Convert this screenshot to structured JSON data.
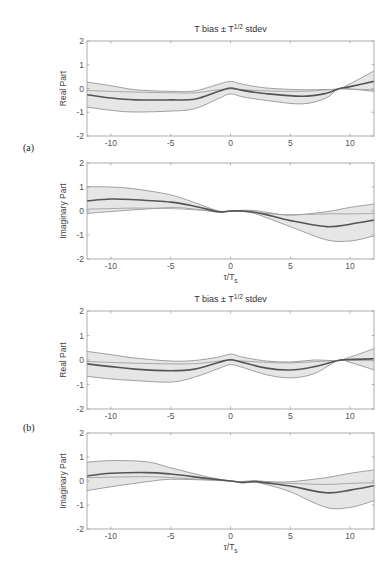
{
  "figure": {
    "width": 392,
    "height": 573,
    "colors": {
      "band_fill": "#e6e6e6",
      "band_edge": "#8a8a8a",
      "mean_line": "#555555",
      "ref_line": "#a0a0a0",
      "axis": "#9a9a9a"
    }
  },
  "chart_data": [
    {
      "type": "area",
      "group": "(a)",
      "title": "T bias ± T^{1/2} stdev",
      "title_main": "T bias ± T",
      "title_sup": "1/2",
      "title_tail": " stdev",
      "xlabel": "",
      "ylabel": "Real Part",
      "xlim": [
        -12,
        12
      ],
      "ylim": [
        -2,
        2
      ],
      "xticks": [
        -10,
        -5,
        0,
        5,
        10
      ],
      "yticks": [
        -2,
        -1,
        0,
        1,
        2
      ],
      "grid": false,
      "box": {
        "x0": 87,
        "x1": 374,
        "y_top": 41,
        "y_bot": 136
      },
      "x": [
        -12,
        -10,
        -8,
        -5,
        -3,
        -1,
        0,
        1,
        3,
        6,
        8,
        9,
        10,
        12
      ],
      "series": [
        {
          "name": "upper (bias + stdev)",
          "values": [
            0.27,
            0.12,
            -0.05,
            -0.12,
            -0.1,
            0.18,
            0.3,
            0.18,
            0.02,
            -0.05,
            -0.04,
            -0.02,
            0.2,
            0.74
          ]
        },
        {
          "name": "bias (mean)",
          "values": [
            -0.26,
            -0.4,
            -0.48,
            -0.48,
            -0.45,
            -0.12,
            0.02,
            -0.08,
            -0.22,
            -0.33,
            -0.2,
            -0.02,
            0.08,
            0.3
          ]
        },
        {
          "name": "lower (bias - stdev)",
          "values": [
            -0.78,
            -0.92,
            -0.99,
            -0.95,
            -0.85,
            -0.42,
            -0.23,
            -0.35,
            -0.5,
            -0.65,
            -0.4,
            -0.02,
            -0.02,
            -0.12
          ]
        },
        {
          "name": "reference",
          "values": [
            -0.08,
            -0.12,
            -0.15,
            -0.18,
            -0.18,
            -0.05,
            -0.02,
            -0.05,
            -0.1,
            -0.12,
            -0.06,
            -0.02,
            -0.03,
            -0.05
          ]
        }
      ]
    },
    {
      "type": "area",
      "group": "(a)",
      "title": "",
      "xlabel": "τ/T_s",
      "xlabel_main": "τ/T",
      "xlabel_sub": "s",
      "ylabel": "Imaginary Part",
      "xlim": [
        -12,
        12
      ],
      "ylim": [
        -2,
        2
      ],
      "xticks": [
        -10,
        -5,
        0,
        5,
        10
      ],
      "yticks": [
        -2,
        -1,
        0,
        1,
        2
      ],
      "grid": false,
      "box": {
        "x0": 87,
        "x1": 374,
        "y_top": 163,
        "y_bot": 259
      },
      "x": [
        -12,
        -10,
        -8,
        -5,
        -3,
        -1,
        0,
        1,
        2,
        3,
        5,
        8,
        10,
        12
      ],
      "series": [
        {
          "name": "upper (bias + stdev)",
          "values": [
            1.01,
            1.0,
            0.92,
            0.67,
            0.35,
            0.0,
            0.0,
            0.03,
            0.02,
            -0.05,
            -0.17,
            -0.03,
            0.15,
            0.29
          ]
        },
        {
          "name": "bias (mean)",
          "values": [
            0.42,
            0.5,
            0.47,
            0.37,
            0.2,
            -0.03,
            0.0,
            0.0,
            -0.05,
            -0.15,
            -0.4,
            -0.65,
            -0.55,
            -0.38
          ]
        },
        {
          "name": "lower (bias - stdev)",
          "values": [
            -0.1,
            -0.02,
            0.05,
            0.14,
            0.08,
            -0.05,
            0.0,
            -0.02,
            -0.1,
            -0.28,
            -0.65,
            -1.2,
            -1.25,
            -1.04
          ]
        },
        {
          "name": "reference",
          "values": [
            0.08,
            0.1,
            0.12,
            0.1,
            0.05,
            -0.02,
            0.0,
            0.0,
            -0.05,
            -0.1,
            -0.16,
            -0.12,
            -0.12,
            -0.1
          ]
        }
      ]
    },
    {
      "type": "area",
      "group": "(b)",
      "title": "T bias ± T^{1/2} stdev",
      "title_main": "T bias ± T",
      "title_sup": "1/2",
      "title_tail": " stdev",
      "xlabel": "",
      "ylabel": "Real Part",
      "xlim": [
        -12,
        12
      ],
      "ylim": [
        -2,
        2
      ],
      "xticks": [
        -10,
        -5,
        0,
        5,
        10
      ],
      "yticks": [
        -2,
        -1,
        0,
        1,
        2
      ],
      "grid": false,
      "box": {
        "x0": 87,
        "x1": 374,
        "y_top": 311,
        "y_bot": 409
      },
      "x": [
        -12,
        -10,
        -8,
        -5,
        -3,
        -1,
        0,
        1,
        3,
        5,
        7,
        9,
        10,
        12
      ],
      "series": [
        {
          "name": "upper (bias + stdev)",
          "values": [
            0.35,
            0.22,
            0.08,
            -0.04,
            -0.02,
            0.12,
            0.24,
            0.12,
            -0.04,
            -0.08,
            0.0,
            -0.02,
            0.12,
            0.46
          ]
        },
        {
          "name": "bias (mean)",
          "values": [
            -0.16,
            -0.27,
            -0.37,
            -0.44,
            -0.37,
            -0.1,
            0.01,
            -0.1,
            -0.33,
            -0.41,
            -0.27,
            -0.02,
            0.02,
            0.05
          ]
        },
        {
          "name": "lower (bias - stdev)",
          "values": [
            -0.67,
            -0.77,
            -0.84,
            -0.9,
            -0.7,
            -0.35,
            -0.19,
            -0.3,
            -0.6,
            -0.73,
            -0.56,
            -0.02,
            -0.1,
            -0.4
          ]
        },
        {
          "name": "reference",
          "values": [
            -0.06,
            -0.1,
            -0.13,
            -0.16,
            -0.15,
            -0.05,
            -0.01,
            -0.04,
            -0.1,
            -0.12,
            -0.07,
            -0.02,
            -0.02,
            -0.03
          ]
        }
      ]
    },
    {
      "type": "area",
      "group": "(b)",
      "title": "",
      "xlabel": "τ/T_s",
      "xlabel_main": "τ/T",
      "xlabel_sub": "s",
      "ylabel": "Imaginary Part",
      "xlim": [
        -12,
        12
      ],
      "ylim": [
        -2,
        2
      ],
      "xticks": [
        -10,
        -5,
        0,
        5,
        10
      ],
      "yticks": [
        -2,
        -1,
        0,
        1,
        2
      ],
      "grid": false,
      "box": {
        "x0": 87,
        "x1": 374,
        "y_top": 433,
        "y_bot": 529
      },
      "x": [
        -12,
        -10,
        -7,
        -5,
        -2,
        0,
        1,
        2,
        3,
        5,
        8,
        10,
        12
      ],
      "series": [
        {
          "name": "upper (bias + stdev)",
          "values": [
            0.78,
            0.85,
            0.8,
            0.55,
            0.18,
            0.0,
            -0.02,
            0.02,
            -0.02,
            -0.03,
            0.14,
            0.32,
            0.46
          ]
        },
        {
          "name": "bias (mean)",
          "values": [
            0.21,
            0.32,
            0.35,
            0.29,
            0.11,
            0.0,
            -0.06,
            -0.02,
            -0.08,
            -0.21,
            -0.49,
            -0.38,
            -0.2
          ]
        },
        {
          "name": "lower (bias - stdev)",
          "values": [
            -0.4,
            -0.24,
            -0.03,
            0.07,
            0.04,
            0.0,
            -0.08,
            -0.05,
            -0.15,
            -0.45,
            -1.1,
            -1.1,
            -0.82
          ]
        },
        {
          "name": "reference",
          "values": [
            0.14,
            0.16,
            0.18,
            0.14,
            0.05,
            0.0,
            -0.03,
            -0.03,
            -0.06,
            -0.1,
            -0.14,
            -0.1,
            -0.07
          ]
        }
      ]
    }
  ],
  "panel_tags": [
    {
      "label": "(a)",
      "x": 23,
      "y": 151
    },
    {
      "label": "(b)",
      "x": 23,
      "y": 431
    }
  ]
}
